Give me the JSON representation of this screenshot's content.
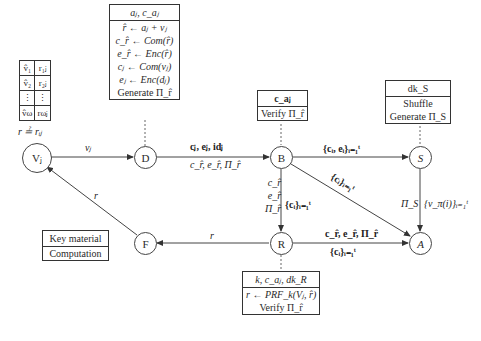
{
  "nodes": {
    "vj": "Vⱼ",
    "d": "D",
    "b": "B",
    "s": "S",
    "r": "R",
    "a": "A",
    "f": "F"
  },
  "voter_table": {
    "rows": [
      [
        "v̂₁",
        "r₁ⱼ"
      ],
      [
        "v̂₂",
        "r₂ⱼ"
      ],
      [
        "⋮",
        "⋮"
      ],
      [
        "v̂ω",
        "rωⱼ"
      ]
    ],
    "check": "r ≟ rᵢⱼ"
  },
  "d_box": {
    "header": "aⱼ, c_aⱼ",
    "rows": [
      "r̂ ← aⱼ + vⱼ",
      "c_r̂ ← Com(r̂)",
      "e_r̂ ← Enc(r̂)",
      "cⱼ ← Com(vⱼ)",
      "eⱼ ← Enc(dⱼ)",
      "Generate Π_r̂"
    ]
  },
  "b_box": {
    "header": "c_aⱼ",
    "rows": [
      "Verify Π_r̂"
    ]
  },
  "s_box": {
    "header": "dk_S",
    "rows": [
      "Shuffle",
      "Generate Π_S"
    ]
  },
  "r_box": {
    "header": "k, c_aⱼ, dk_R",
    "rows": [
      "r ← PRF_k(Vⱼ, r̂)",
      "Verify Π_r̂"
    ]
  },
  "legend": {
    "header": "Key material",
    "rows": [
      "Computation"
    ]
  },
  "edges": {
    "vj_d": "vⱼ",
    "d_b_top": "cⱼ, eⱼ, idⱼ",
    "d_b_bottom": "c_r̂, e_r̂, Π_r̂",
    "b_s": "{cᵢ, eᵢ}ᵢ₌₁ᵗ",
    "b_a": "{cᵢ}ᵢ₌₁ᵗ",
    "b_r_left": [
      "c_r̂",
      "e_r̂",
      "Π_r̂"
    ],
    "b_r_right": "{cᵢ}ᵢ₌₁ᵗ",
    "s_a_left": "Π_S",
    "s_a_right": "{v_π(i)}ᵢ₌₁ᵗ",
    "r_a_top": "c_r̂, e_r̂, Π_r̂",
    "r_a_bottom": "{cᵢ}ᵢ₌₁ᵗ",
    "r_f": "r",
    "f_vj": "r"
  }
}
